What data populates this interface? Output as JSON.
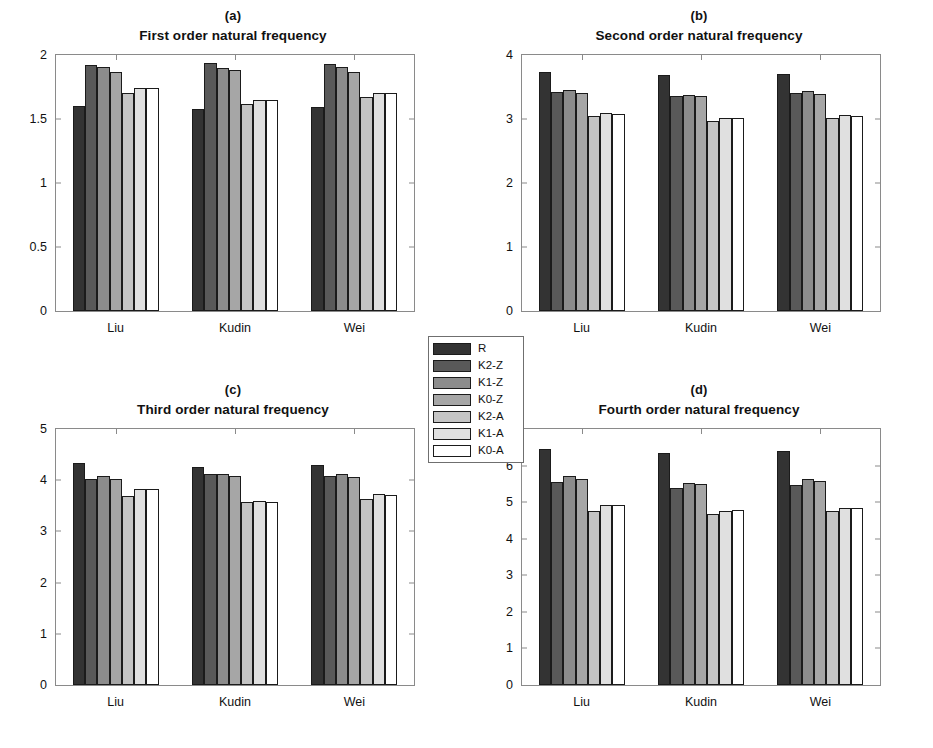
{
  "figure": {
    "width": 933,
    "height": 748,
    "background": "#ffffff"
  },
  "legend": {
    "position": "center",
    "entries": [
      {
        "label": "R",
        "color": "#333333"
      },
      {
        "label": "K2-Z",
        "color": "#595959"
      },
      {
        "label": "K1-Z",
        "color": "#8c8c8c"
      },
      {
        "label": "K0-Z",
        "color": "#a6a6a6"
      },
      {
        "label": "K2-A",
        "color": "#c4c4c4"
      },
      {
        "label": "K1-A",
        "color": "#e0e0e0"
      },
      {
        "label": "K0-A",
        "color": "#ffffff"
      }
    ]
  },
  "chart_data": [
    {
      "type": "bar",
      "panel": "(a)",
      "title": "First order natural frequency",
      "xlabel": "",
      "ylabel": "",
      "categories": [
        "Liu",
        "Kudin",
        "Wei"
      ],
      "ylim": [
        0,
        2
      ],
      "yticks": [
        0,
        0.5,
        1,
        1.5,
        2
      ],
      "ytick_labels": [
        "0",
        "0.5",
        "1",
        "1.5",
        "2"
      ],
      "grid": false,
      "series": [
        {
          "name": "R",
          "values": [
            1.6,
            1.58,
            1.59
          ]
        },
        {
          "name": "K2-Z",
          "values": [
            1.92,
            1.94,
            1.93
          ]
        },
        {
          "name": "K1-Z",
          "values": [
            1.91,
            1.9,
            1.91
          ]
        },
        {
          "name": "K0-Z",
          "values": [
            1.87,
            1.88,
            1.87
          ]
        },
        {
          "name": "K2-A",
          "values": [
            1.7,
            1.62,
            1.67
          ]
        },
        {
          "name": "K1-A",
          "values": [
            1.74,
            1.65,
            1.7
          ]
        },
        {
          "name": "K0-A",
          "values": [
            1.74,
            1.65,
            1.7
          ]
        }
      ]
    },
    {
      "type": "bar",
      "panel": "(b)",
      "title": "Second order natural frequency",
      "xlabel": "",
      "ylabel": "",
      "categories": [
        "Liu",
        "Kudin",
        "Wei"
      ],
      "ylim": [
        0,
        4
      ],
      "yticks": [
        0,
        1,
        2,
        3,
        4
      ],
      "ytick_labels": [
        "0",
        "1",
        "2",
        "3",
        "4"
      ],
      "grid": false,
      "series": [
        {
          "name": "R",
          "values": [
            3.74,
            3.68,
            3.71
          ]
        },
        {
          "name": "K2-Z",
          "values": [
            3.42,
            3.36,
            3.4
          ]
        },
        {
          "name": "K1-Z",
          "values": [
            3.46,
            3.38,
            3.43
          ]
        },
        {
          "name": "K0-Z",
          "values": [
            3.41,
            3.36,
            3.39
          ]
        },
        {
          "name": "K2-A",
          "values": [
            3.04,
            2.97,
            3.01
          ]
        },
        {
          "name": "K1-A",
          "values": [
            3.09,
            3.02,
            3.06
          ]
        },
        {
          "name": "K0-A",
          "values": [
            3.08,
            3.02,
            3.05
          ]
        }
      ]
    },
    {
      "type": "bar",
      "panel": "(c)",
      "title": "Third order natural frequency",
      "xlabel": "",
      "ylabel": "",
      "categories": [
        "Liu",
        "Kudin",
        "Wei"
      ],
      "ylim": [
        0,
        5
      ],
      "yticks": [
        0,
        1,
        2,
        3,
        4,
        5
      ],
      "ytick_labels": [
        "0",
        "1",
        "2",
        "3",
        "4",
        "5"
      ],
      "grid": false,
      "series": [
        {
          "name": "R",
          "values": [
            4.33,
            4.26,
            4.3
          ]
        },
        {
          "name": "K2-Z",
          "values": [
            4.02,
            4.13,
            4.08
          ]
        },
        {
          "name": "K1-Z",
          "values": [
            4.09,
            4.13,
            4.12
          ]
        },
        {
          "name": "K0-Z",
          "values": [
            4.03,
            4.08,
            4.06
          ]
        },
        {
          "name": "K2-A",
          "values": [
            3.7,
            3.57,
            3.64
          ]
        },
        {
          "name": "K1-A",
          "values": [
            3.83,
            3.6,
            3.73
          ]
        },
        {
          "name": "K0-A",
          "values": [
            3.83,
            3.58,
            3.72
          ]
        }
      ]
    },
    {
      "type": "bar",
      "panel": "(d)",
      "title": "Fourth order natural frequency",
      "xlabel": "",
      "ylabel": "",
      "categories": [
        "Liu",
        "Kudin",
        "Wei"
      ],
      "ylim": [
        0,
        7
      ],
      "yticks": [
        0,
        1,
        2,
        3,
        4,
        5,
        6,
        7
      ],
      "ytick_labels": [
        "0",
        "1",
        "2",
        "3",
        "4",
        "5",
        "6",
        "7"
      ],
      "grid": false,
      "series": [
        {
          "name": "R",
          "values": [
            6.45,
            6.35,
            6.41
          ]
        },
        {
          "name": "K2-Z",
          "values": [
            5.54,
            5.38,
            5.48
          ]
        },
        {
          "name": "K1-Z",
          "values": [
            5.72,
            5.52,
            5.64
          ]
        },
        {
          "name": "K0-Z",
          "values": [
            5.62,
            5.5,
            5.59
          ]
        },
        {
          "name": "K2-A",
          "values": [
            4.77,
            4.68,
            4.75
          ]
        },
        {
          "name": "K1-A",
          "values": [
            4.91,
            4.77,
            4.84
          ]
        },
        {
          "name": "K0-A",
          "values": [
            4.91,
            4.78,
            4.85
          ]
        }
      ]
    }
  ]
}
